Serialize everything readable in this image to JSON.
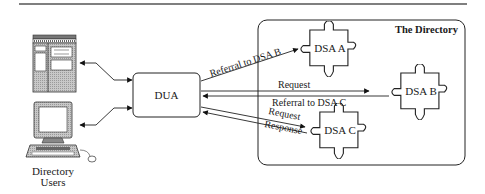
{
  "diagram": {
    "container": {
      "label": "The Directory"
    },
    "users": {
      "label_line1": "Directory",
      "label_line2": "Users",
      "icons": [
        "server-terminal-icon",
        "workstation-computer-icon"
      ]
    },
    "dua": {
      "label": "DUA"
    },
    "dsas": [
      {
        "id": "dsa-a",
        "label": "DSA A"
      },
      {
        "id": "dsa-b",
        "label": "DSA B"
      },
      {
        "id": "dsa-c",
        "label": "DSA C"
      }
    ],
    "edges": [
      {
        "id": "referral-to-dsa-b",
        "label": "Referral to DSA B",
        "from": "DUA",
        "to": "DSA A"
      },
      {
        "id": "request-b",
        "label": "Request",
        "from": "DUA",
        "to": "DSA B"
      },
      {
        "id": "referral-to-dsa-c",
        "label": "Referral to DSA C",
        "from": "DSA B",
        "to": "DUA"
      },
      {
        "id": "request-c",
        "label": "Request",
        "from": "DUA",
        "to": "DSA C"
      },
      {
        "id": "response-c",
        "label": "Response",
        "from": "DSA C",
        "to": "DUA"
      }
    ]
  }
}
